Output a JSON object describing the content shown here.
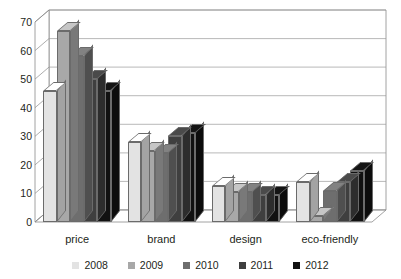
{
  "chart_data": {
    "type": "bar",
    "title": "",
    "subtitle": "",
    "xlabel": "",
    "ylabel": "",
    "categories": [
      "price",
      "brand",
      "design",
      "eco-friendly"
    ],
    "series": [
      {
        "name": "2008",
        "color": "#e3e3e3",
        "values": [
          46,
          28,
          12.5,
          14
        ]
      },
      {
        "name": "2009",
        "color": "#a8a8a8",
        "values": [
          67,
          25,
          10.5,
          2
        ]
      },
      {
        "name": "2010",
        "color": "#6e6e6e",
        "values": [
          58,
          24,
          10.5,
          11
        ]
      },
      {
        "name": "2011",
        "color": "#3f3f3f",
        "values": [
          50,
          30,
          9.5,
          14
        ]
      },
      {
        "name": "2012",
        "color": "#111111",
        "values": [
          46,
          31,
          9.5,
          18
        ]
      }
    ],
    "ylim": [
      0,
      70
    ],
    "yticks": [
      0,
      10,
      20,
      30,
      40,
      50,
      60,
      70
    ],
    "grid": true,
    "legend_position": "bottom",
    "style": "3d-column",
    "axis_color": "#808080",
    "grid_color": "#9b9b9b",
    "background": "#ffffff"
  }
}
